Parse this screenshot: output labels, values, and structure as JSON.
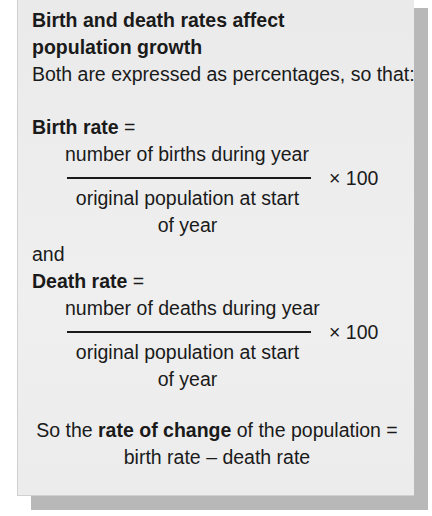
{
  "box": {
    "heading_line1": "Birth and death rates affect",
    "heading_line2": "population growth",
    "intro": "Both are expressed as percentages, so that:",
    "birth_rate": {
      "label": "Birth rate",
      "equals": " =",
      "numerator": "number of births during year",
      "denominator_line1": "original population at start",
      "denominator_line2": "of year",
      "multiplier": "× 100"
    },
    "connector": "and",
    "death_rate": {
      "label": "Death rate",
      "equals": " =",
      "numerator": "number of deaths during year",
      "denominator_line1": "original population at start",
      "denominator_line2": "of year",
      "multiplier": "× 100"
    },
    "summary": {
      "prefix": "So the ",
      "bold": "rate of change",
      "suffix": " of the population =",
      "line2": "birth rate – death rate"
    }
  },
  "colors": {
    "background": "#ececec",
    "shadow": "#b8b8b8",
    "text": "#1a1a1a"
  }
}
